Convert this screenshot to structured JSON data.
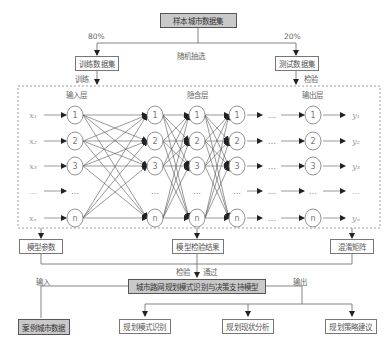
{
  "top": {
    "dataset": "样本城市数据集",
    "split_label": "随机抽选",
    "train_pct": "80%",
    "test_pct": "20%",
    "train_set": "训练数据集",
    "test_set": "测试数据集",
    "train_action": "训练",
    "test_action": "检验"
  },
  "network": {
    "layers": [
      "输入层",
      "隐含层",
      "输出层"
    ],
    "inputs": [
      "x₁",
      "x₂",
      "x₃",
      "…",
      "xₙ"
    ],
    "outputs": [
      "y₁",
      "y₂",
      "y₃",
      "…",
      "yₙ"
    ],
    "node_labels": [
      "1",
      "2",
      "3",
      "…",
      "n"
    ],
    "ellipsis": "…"
  },
  "results": {
    "params": "模型参数",
    "test_result": "模型检验结果",
    "confusion": "混淆矩阵"
  },
  "model": {
    "check": "检验",
    "pass": "通过",
    "name": "城市路网规划模式识别与决策支持模型",
    "input_label": "输入",
    "output_label": "输出",
    "case_data": "案例城市数据",
    "outputs": [
      "规划模式识别",
      "规划现状分析",
      "规划策略建议"
    ]
  },
  "colors": {
    "line": "#666666",
    "box_border": "#777777",
    "gray_fill": "#c9c9c9"
  }
}
